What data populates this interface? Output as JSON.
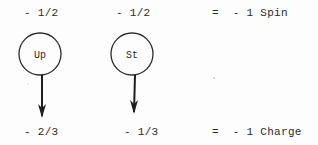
{
  "diagram": {
    "particles": [
      {
        "label": "Up",
        "spin": "- 1/2",
        "charge": "- 2/3"
      },
      {
        "label": "St",
        "spin": "- 1/2",
        "charge": "- 1/3"
      }
    ],
    "totals": {
      "spin": "=  - 1 Spin",
      "charge": "=  - 1 Charge"
    }
  },
  "colors": {
    "ink": "#2a2a2a",
    "paper": "#fdfdfd"
  }
}
